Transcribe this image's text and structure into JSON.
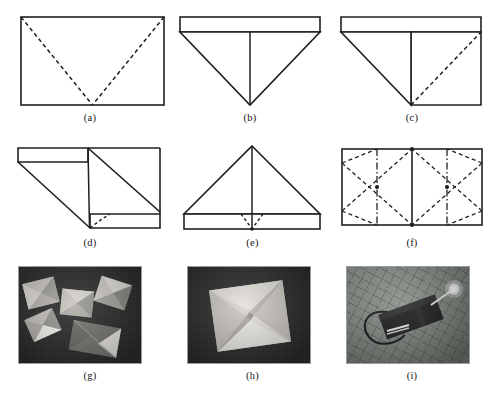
{
  "figure": {
    "type": "multi-panel-figure",
    "columns": 3,
    "rows": 3,
    "background_color": "#ffffff",
    "line_color": "#231f20"
  },
  "panels": [
    {
      "id": "a",
      "caption": "(a)",
      "kind": "line-drawing",
      "description": "Rectangular sheet with two dashed valley creases running from the upper-left and upper-right corners to the midpoint of the bottom edge."
    },
    {
      "id": "b",
      "caption": "(b)",
      "kind": "line-drawing",
      "description": "Sheet after folding: narrow horizontal band across the top with a downward-pointing triangle hanging below it, split by a vertical center line."
    },
    {
      "id": "c",
      "caption": "(c)",
      "kind": "line-drawing",
      "description": "Left half folded down into a triangle; dashed diagonal crease marked on the right half from bottom center to top-right corner."
    },
    {
      "id": "d",
      "caption": "(d)",
      "kind": "line-drawing",
      "description": "Both halves folded to form a slanted parallelogram with narrow bands at the upper left and lower right; short dashed crease near the bottom center."
    },
    {
      "id": "e",
      "caption": "(e)",
      "kind": "line-drawing",
      "description": "Unfolded to an upward-pointing triangle standing on a horizontal band, with a small dashed V converging on the band's center point."
    },
    {
      "id": "f",
      "caption": "(f)",
      "kind": "line-drawing",
      "description": "Final crease pattern: rectangle with dashed diagonal creases forming two X shapes, dash-dot vertical lines at the quarter positions, and a solid vertical center line."
    },
    {
      "id": "g",
      "caption": "(g)",
      "kind": "photograph",
      "description": "Photograph of six folded paper modules with pyramidal facets scattered on a dark background."
    },
    {
      "id": "h",
      "caption": "(h)",
      "kind": "photograph",
      "description": "Close-up photograph of a single folded paper module: a square cell with four triangular facets converging inward, on a dark background."
    },
    {
      "id": "i",
      "caption": "(i)",
      "kind": "photograph",
      "description": "Photograph on a gridded cutting mat of a dark folded module wired to a small illuminated LED."
    }
  ]
}
